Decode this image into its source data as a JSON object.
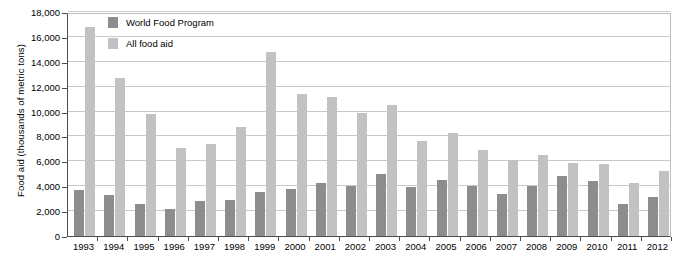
{
  "chart_data": {
    "type": "bar",
    "title": "",
    "xlabel": "",
    "ylabel": "Food aid (thousands of metric tons)",
    "ylim": [
      0,
      18000
    ],
    "ytick_values": [
      0,
      2000,
      4000,
      6000,
      8000,
      10000,
      12000,
      14000,
      16000,
      18000
    ],
    "ytick_labels": [
      "0",
      "2,000",
      "4,000",
      "6,000",
      "8,000",
      "10,000",
      "12,000",
      "14,000",
      "16,000",
      "18,000"
    ],
    "grid": true,
    "legend_position": "top-left-inside",
    "categories": [
      "1993",
      "1994",
      "1995",
      "1996",
      "1997",
      "1998",
      "1999",
      "2000",
      "2001",
      "2002",
      "2003",
      "2004",
      "2005",
      "2006",
      "2007",
      "2008",
      "2009",
      "2010",
      "2011",
      "2012"
    ],
    "series": [
      {
        "name": "World Food Program",
        "color": "#8d8d8d",
        "values": [
          3700,
          3300,
          2600,
          2200,
          2800,
          2900,
          3500,
          3800,
          4300,
          4000,
          5000,
          3900,
          4500,
          4000,
          3400,
          4000,
          4800,
          4400,
          2600,
          3100
        ]
      },
      {
        "name": "All food aid",
        "color": "#c2c2c2",
        "values": [
          16800,
          12700,
          9800,
          7100,
          7400,
          8800,
          14800,
          11400,
          11200,
          9900,
          10500,
          7600,
          8300,
          6900,
          6100,
          6500,
          5900,
          5800,
          4300,
          5200
        ]
      }
    ]
  },
  "axis": {
    "line_color": "#4d4d4d",
    "grid_color": "#c8c8c8"
  }
}
